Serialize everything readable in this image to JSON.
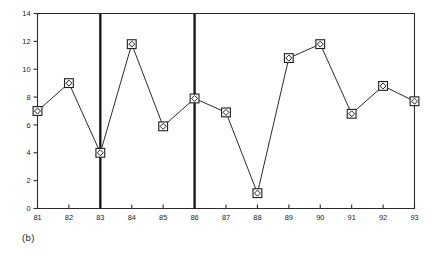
{
  "figure": {
    "caption": "(b)"
  },
  "chart_data": {
    "type": "line",
    "title": "",
    "xlabel": "",
    "ylabel": "",
    "categories": [
      "81",
      "82",
      "83",
      "84",
      "85",
      "86",
      "87",
      "88",
      "89",
      "90",
      "91",
      "92",
      "93"
    ],
    "x": [
      81,
      82,
      83,
      84,
      85,
      86,
      87,
      88,
      89,
      90,
      91,
      92,
      93
    ],
    "values": [
      7.0,
      9.0,
      4.0,
      11.8,
      5.9,
      7.9,
      6.9,
      1.1,
      10.8,
      11.8,
      6.8,
      8.8,
      7.7
    ],
    "series": [
      {
        "name": "",
        "values": [
          7.0,
          9.0,
          4.0,
          11.8,
          5.9,
          7.9,
          6.9,
          1.1,
          10.8,
          11.8,
          6.8,
          8.8,
          7.7
        ]
      }
    ],
    "ylim": [
      0,
      14
    ],
    "xlim": [
      81,
      93
    ],
    "yticks": [
      0,
      2,
      4,
      6,
      8,
      10,
      12,
      14
    ],
    "ytick_labels": [
      "0",
      "2",
      "4",
      "6",
      "8",
      "10",
      "12",
      "14"
    ],
    "xticks": [
      81,
      82,
      83,
      84,
      85,
      86,
      87,
      88,
      89,
      90,
      91,
      92,
      93
    ],
    "xtick_labels": [
      "81",
      "82",
      "83",
      "84",
      "85",
      "86",
      "87",
      "88",
      "89",
      "90",
      "91",
      "92",
      "93"
    ],
    "grid": false,
    "legend": null,
    "marker": "square-with-diamond",
    "annotations": [
      {
        "type": "vertical-line",
        "x": 83,
        "label": ""
      },
      {
        "type": "vertical-line",
        "x": 86,
        "label": ""
      }
    ],
    "line_color": "#2b2b2b",
    "marker_face_color": "#ffffff",
    "marker_edge_color": "#1f1f1f",
    "event_line_color": "#1a1a1a",
    "axis_color": "#2b2b2b",
    "background_color": "#ffffff"
  }
}
